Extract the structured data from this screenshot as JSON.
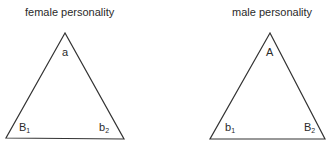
{
  "diagrams": [
    {
      "title": "female personality",
      "apex": {
        "main": "a",
        "sub": ""
      },
      "left": {
        "main": "B",
        "sub": "1"
      },
      "right": {
        "main": "b",
        "sub": "2"
      }
    },
    {
      "title": "male personality",
      "apex": {
        "main": "A",
        "sub": ""
      },
      "left": {
        "main": "b",
        "sub": "1"
      },
      "right": {
        "main": "B",
        "sub": "2"
      }
    }
  ],
  "colors": {
    "line": "#333333",
    "text": "#2a2a2a"
  }
}
